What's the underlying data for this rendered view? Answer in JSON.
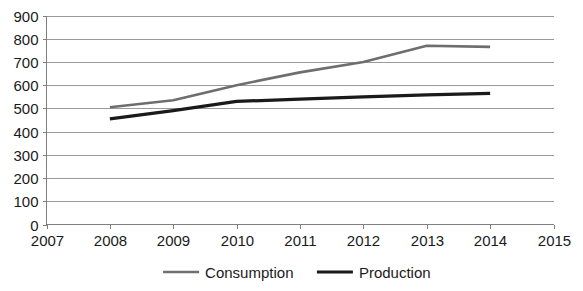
{
  "chart_data": {
    "type": "line",
    "title": "",
    "subtitle": "",
    "xlabel": "",
    "ylabel": "",
    "x": [
      2008,
      2009,
      2010,
      2011,
      2012,
      2013,
      2014
    ],
    "xlim": [
      2007,
      2015
    ],
    "ylim": [
      0,
      900
    ],
    "xticks": [
      "2007",
      "2008",
      "2009",
      "2010",
      "2011",
      "2012",
      "2013",
      "2014",
      "2015"
    ],
    "yticks": [
      "0",
      "100",
      "200",
      "300",
      "400",
      "500",
      "600",
      "700",
      "800",
      "900"
    ],
    "grid": "horizontal",
    "legend_position": "bottom",
    "series": [
      {
        "name": "Consumption",
        "color": "#6e6e6e",
        "stroke_width": 2.6,
        "values": [
          505,
          535,
          600,
          655,
          700,
          770,
          765
        ]
      },
      {
        "name": "Production",
        "color": "#1a1a1a",
        "stroke_width": 3.2,
        "values": [
          455,
          490,
          530,
          540,
          550,
          558,
          565
        ]
      }
    ]
  },
  "axes": {
    "y_axis_name": "value-axis",
    "x_axis_name": "year-axis"
  },
  "legend": {
    "items": [
      {
        "label": "Consumption",
        "color": "#6e6e6e"
      },
      {
        "label": "Production",
        "color": "#1a1a1a"
      }
    ]
  },
  "colors": {
    "gridline": "#9a9a9a",
    "axis": "#7f7f7f",
    "text": "#1a1a1a",
    "background": "#ffffff"
  }
}
